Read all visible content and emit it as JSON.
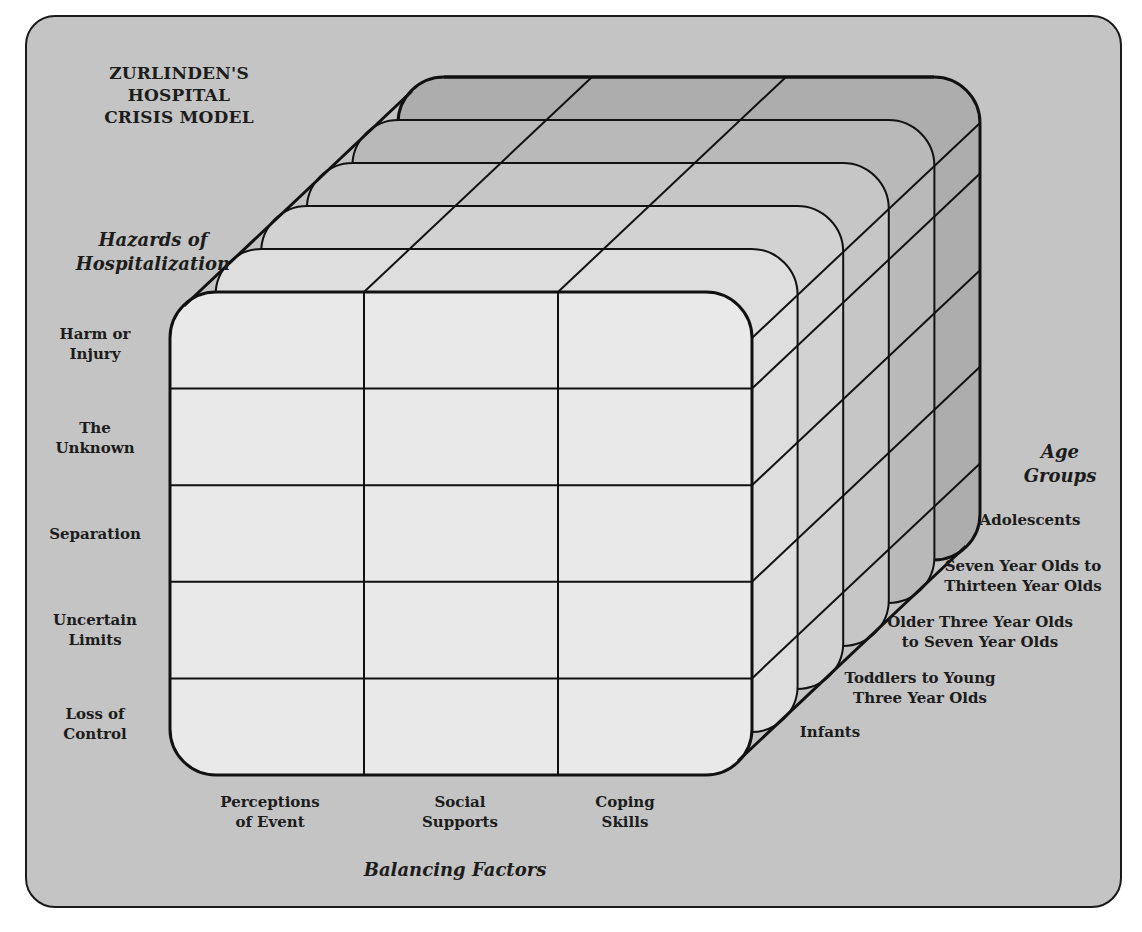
{
  "title": "ZURLINDEN'S HOSPITAL\nCRISIS MODEL",
  "axes": {
    "hazards": "Hazards of\nHospitalization",
    "balancing": "Balancing Factors",
    "age": "Age\nGroups"
  },
  "hazards": [
    "Harm or\nInjury",
    "The\nUnknown",
    "Separation",
    "Uncertain\nLimits",
    "Loss of\nControl"
  ],
  "balancing_factors": [
    "Perceptions\nof Event",
    "Social\nSupports",
    "Coping\nSkills"
  ],
  "age_groups": [
    "Infants",
    "Toddlers to Young\nThree Year Olds",
    "Older Three Year Olds\nto Seven Year Olds",
    "Seven Year Olds to\nThirteen Year Olds",
    "Adolescents"
  ],
  "colors": {
    "panel": "#c4c4c4",
    "front_face": "#e9e9e9",
    "layer_shades": [
      "#e9e9e9",
      "#dedede",
      "#d2d2d2",
      "#c6c6c6",
      "#b9b9b9",
      "#adadad"
    ],
    "line": "#111111"
  }
}
